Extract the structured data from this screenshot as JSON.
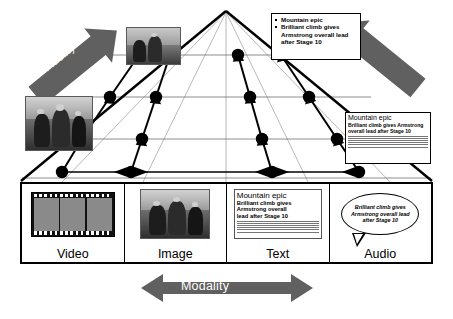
{
  "axes": {
    "fidelity_left_label": "Fidelity",
    "fidelity_right_label": "Fidelity",
    "modality_label": "Modality"
  },
  "bullet_callout": {
    "items": [
      "Mountain epic",
      "Brilliant climb gives Armstrong overall lead after Stage 10"
    ]
  },
  "mini_article": {
    "headline": "Mountain epic",
    "subhead": "Brilliant climb gives Armstrong overall lead after Stage 10",
    "body_lines": 6
  },
  "panels": [
    {
      "label": "Video",
      "content_type": "filmstrip",
      "frames": 3
    },
    {
      "label": "Image",
      "content_type": "photo"
    },
    {
      "label": "Text",
      "content_type": "article",
      "article": {
        "headline": "Mountain epic",
        "subhead_line1": "Brilliant climb gives",
        "subhead_line2": "Armstrong overall",
        "subhead_line3": "lead after Stage 10",
        "body_lines": 6
      }
    },
    {
      "label": "Audio",
      "content_type": "speech-bubble",
      "bubble_text": "Brilliant climb gives Armstrong overall lead after Stage 10"
    }
  ],
  "photos": [
    {
      "name": "mountain-landscape-photo",
      "kind": "landscape"
    },
    {
      "name": "cyclists-photo",
      "kind": "cyclists"
    }
  ],
  "colors": {
    "arrow_gray": "#606060",
    "line_black": "#000000",
    "grid_gray": "#8f8f8f",
    "panel_background": "#ffffff"
  },
  "pyramid": {
    "columns": 4,
    "levels": 4,
    "node_count": 16
  }
}
